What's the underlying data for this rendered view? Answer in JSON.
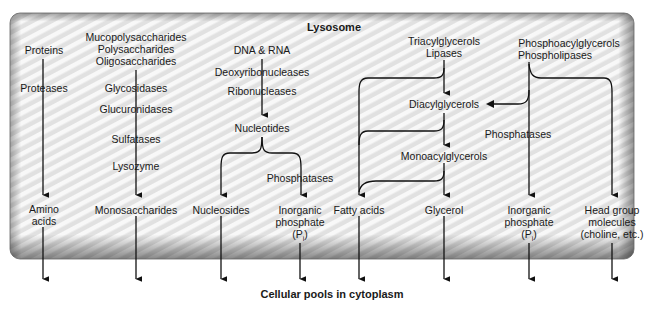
{
  "compartment": {
    "title": "Lysosome",
    "bottom_label": "Cellular pools in cytoplasm"
  },
  "columns": {
    "proteins": {
      "substrate": "Proteins",
      "enzymes": [
        "Proteases"
      ],
      "product": [
        "Amino",
        "acids"
      ]
    },
    "carbohydrates": {
      "substrates": [
        "Mucopolysaccharides",
        "Polysaccharides",
        "Oligosaccharides"
      ],
      "enzymes": [
        "Glycosidases",
        "Glucuronidases",
        "Sulfatases",
        "Lysozyme"
      ],
      "product": "Monosaccharides"
    },
    "nucleic_acids": {
      "substrate": "DNA & RNA",
      "enzymes": [
        "Deoxyribonucleases",
        "Ribonucleases"
      ],
      "intermediate": "Nucleotides",
      "secondary_enzyme": "Phosphatases",
      "products": [
        "Nucleosides",
        [
          "Inorganic",
          "phosphate",
          "(P",
          "i",
          ")"
        ]
      ]
    },
    "lipids": {
      "substrate": "Triacylglycerols",
      "enzyme": "Lipases",
      "intermediates": [
        "Diacylglycerols",
        "Monoacylglycerols"
      ],
      "products": [
        "Fatty acids",
        "Glycerol"
      ]
    },
    "phospholipids": {
      "substrates": [
        "Phosphoacylglycerols",
        "Phospholipases"
      ],
      "secondary_enzyme": "Phosphatases",
      "products": [
        [
          "Inorganic",
          "phosphate",
          "(P",
          "i",
          ")"
        ],
        [
          "Head group",
          "molecules",
          "(choline, etc.)"
        ]
      ]
    }
  },
  "colors": {
    "stroke": "#111111",
    "box_fill": "#e9e9e9",
    "box_stripe": "#f7f7f7",
    "box_border": "#5a5a5a"
  }
}
